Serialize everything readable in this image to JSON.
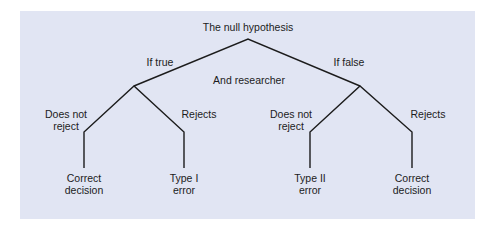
{
  "diagram": {
    "root": "The null hypothesis",
    "branch_left": "If true",
    "branch_right": "If false",
    "middle": "And researcher",
    "left": {
      "does_not_reject_1": "Does not",
      "does_not_reject_2": "reject",
      "rejects": "Rejects",
      "outcome_keep_1": "Correct",
      "outcome_keep_2": "decision",
      "outcome_reject_1": "Type I",
      "outcome_reject_2": "error"
    },
    "right": {
      "does_not_reject_1": "Does not",
      "does_not_reject_2": "reject",
      "rejects": "Rejects",
      "outcome_keep_1": "Type II",
      "outcome_keep_2": "error",
      "outcome_reject_1": "Correct",
      "outcome_reject_2": "decision"
    },
    "colors": {
      "background": "#e1e5f3",
      "line": "#1c1c1c",
      "text": "#1c1c1c"
    }
  }
}
